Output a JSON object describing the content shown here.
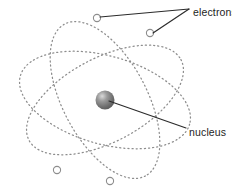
{
  "diagram": {
    "background_color": "#ffffff",
    "labels": {
      "electrons": "electrons",
      "nucleus": "nucleus"
    },
    "colors": {
      "orbit_stroke": "#8d8d8d",
      "electron_fill": "#ffffff",
      "electron_stroke": "#8d8d8d",
      "leader_line": "#2b2b2b",
      "label_text": "#1d1d1d",
      "nucleus_core": "#6f6f6f",
      "nucleus_highlight": "#d9d9d9",
      "nucleus_edge": "#5a5a5a"
    },
    "nucleus": {
      "cx": 105,
      "cy": 100,
      "r": 9.5
    },
    "orbits": [
      {
        "name": "orbit-1",
        "cx": 105,
        "cy": 100,
        "rx": 86,
        "ry": 42,
        "rotation": -28
      },
      {
        "name": "orbit-2",
        "cx": 105,
        "cy": 100,
        "rx": 86,
        "ry": 42,
        "rotation": 62
      },
      {
        "name": "orbit-3",
        "cx": 105,
        "cy": 100,
        "rx": 88,
        "ry": 44,
        "rotation": 16
      }
    ],
    "electrons": [
      {
        "name": "electron-top-left",
        "cx": 97,
        "cy": 18,
        "r": 3.6
      },
      {
        "name": "electron-top-right",
        "cx": 150,
        "cy": 33,
        "r": 3.6
      },
      {
        "name": "electron-bottom-left",
        "cx": 57,
        "cy": 170,
        "r": 3.6
      },
      {
        "name": "electron-bottom-right",
        "cx": 110,
        "cy": 181,
        "r": 3.6
      }
    ],
    "leaders": {
      "electrons_junction": {
        "x": 189,
        "y": 9
      },
      "electrons_lines": [
        {
          "x1": 189,
          "y1": 9,
          "x2": 100,
          "y2": 17
        },
        {
          "x1": 189,
          "y1": 9,
          "x2": 153,
          "y2": 33
        }
      ],
      "electrons_label_pos": {
        "x": 193,
        "y": 13
      },
      "nucleus_line": {
        "x1": 109,
        "y1": 101,
        "x2": 186,
        "y2": 128
      },
      "nucleus_label_pos": {
        "x": 189,
        "y": 133
      }
    }
  }
}
